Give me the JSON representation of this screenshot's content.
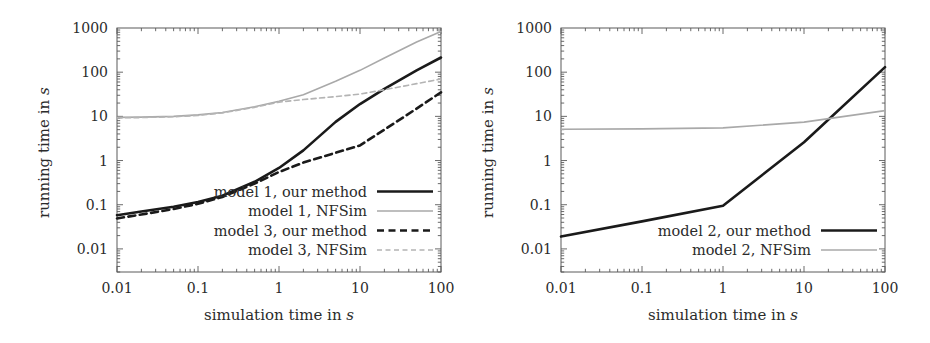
{
  "figure": {
    "panels": [
      {
        "id": "left",
        "xlabel_prefix": "simulation time in ",
        "xlabel_unit": "s",
        "ylabel_prefix": "running time in ",
        "ylabel_unit": "s",
        "xticks": [
          "0.01",
          "0.1",
          "1",
          "10",
          "100"
        ],
        "yticks": [
          "0.01",
          "0.1",
          "1",
          "10",
          "100",
          "1000"
        ],
        "legend": [
          {
            "label": "model 1, our method",
            "color": "#1a1a1a",
            "style": "solid",
            "width": 2.6
          },
          {
            "label": "model 1, NFSim",
            "color": "#a9a9a9",
            "style": "solid",
            "width": 1.6
          },
          {
            "label": "model 3, our method",
            "color": "#1a1a1a",
            "style": "dashed",
            "width": 2.6
          },
          {
            "label": "model 3, NFSim",
            "color": "#b4b4b4",
            "style": "dashed",
            "width": 1.6
          }
        ]
      },
      {
        "id": "right",
        "xlabel_prefix": "simulation time in ",
        "xlabel_unit": "s",
        "ylabel_prefix": "running time in ",
        "ylabel_unit": "s",
        "xticks": [
          "0.01",
          "0.1",
          "1",
          "10",
          "100"
        ],
        "yticks": [
          "0.01",
          "0.1",
          "1",
          "10",
          "100",
          "1000"
        ],
        "legend": [
          {
            "label": "model 2, our method",
            "color": "#1a1a1a",
            "style": "solid",
            "width": 2.6
          },
          {
            "label": "model 2, NFSim",
            "color": "#a9a9a9",
            "style": "solid",
            "width": 1.6
          }
        ]
      }
    ]
  },
  "chart_data": [
    {
      "type": "line",
      "panel": "left",
      "title": "",
      "xlabel": "simulation time in s",
      "ylabel": "running time in s",
      "xscale": "log",
      "yscale": "log",
      "xlim": [
        0.01,
        100
      ],
      "ylim": [
        0.003,
        1000
      ],
      "grid": false,
      "legend_position": "lower-right-inside",
      "series": [
        {
          "name": "model 1, our method",
          "color": "#1a1a1a",
          "style": "solid",
          "x": [
            0.01,
            0.02,
            0.05,
            0.1,
            0.2,
            0.5,
            1,
            2,
            5,
            10,
            20,
            50,
            100
          ],
          "y": [
            0.058,
            0.07,
            0.09,
            0.115,
            0.16,
            0.33,
            0.68,
            1.7,
            7.5,
            19,
            42,
            110,
            215
          ]
        },
        {
          "name": "model 1, NFSim",
          "color": "#a9a9a9",
          "style": "solid",
          "x": [
            0.01,
            0.02,
            0.05,
            0.1,
            0.2,
            0.5,
            1,
            2,
            5,
            10,
            20,
            50,
            100
          ],
          "y": [
            9.5,
            9.6,
            10.0,
            10.8,
            12.2,
            16.5,
            22,
            31,
            62,
            110,
            210,
            480,
            830
          ]
        },
        {
          "name": "model 3, our method",
          "color": "#1a1a1a",
          "style": "dashed",
          "x": [
            0.01,
            0.02,
            0.05,
            0.1,
            0.2,
            0.5,
            1,
            2,
            5,
            10,
            20,
            50,
            100
          ],
          "y": [
            0.049,
            0.06,
            0.08,
            0.105,
            0.15,
            0.3,
            0.55,
            0.9,
            1.5,
            2.2,
            5.0,
            15,
            35
          ]
        },
        {
          "name": "model 3, NFSim",
          "color": "#b4b4b4",
          "style": "dashed",
          "x": [
            0.01,
            0.02,
            0.05,
            0.1,
            0.2,
            0.5,
            1,
            2,
            5,
            10,
            20,
            50,
            100
          ],
          "y": [
            9.2,
            9.4,
            9.8,
            10.5,
            12.0,
            16.0,
            21,
            24,
            28,
            32,
            40,
            55,
            70
          ]
        }
      ]
    },
    {
      "type": "line",
      "panel": "right",
      "title": "",
      "xlabel": "simulation time in s",
      "ylabel": "running time in s",
      "xscale": "log",
      "yscale": "log",
      "xlim": [
        0.01,
        100
      ],
      "ylim": [
        0.003,
        1000
      ],
      "grid": false,
      "legend_position": "lower-right-inside",
      "series": [
        {
          "name": "model 2, our method",
          "color": "#1a1a1a",
          "style": "solid",
          "x": [
            0.01,
            0.1,
            1,
            10,
            100
          ],
          "y": [
            0.019,
            0.042,
            0.095,
            2.6,
            130
          ]
        },
        {
          "name": "model 2, NFSim",
          "color": "#a9a9a9",
          "style": "solid",
          "x": [
            0.01,
            0.1,
            1,
            10,
            100
          ],
          "y": [
            5.1,
            5.2,
            5.5,
            7.4,
            13.5
          ]
        }
      ]
    }
  ]
}
